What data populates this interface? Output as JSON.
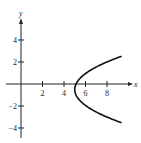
{
  "chart_data": {
    "type": "line",
    "title": "",
    "xlabel": "x",
    "ylabel": "y",
    "xlim": [
      -0.5,
      10
    ],
    "ylim": [
      -5,
      6
    ],
    "grid": false,
    "legend": null,
    "x_ticks": [
      2,
      4,
      6,
      8
    ],
    "y_ticks": [
      4,
      2,
      -2,
      -4
    ],
    "x_tick_labels": [
      "2",
      "4",
      "6",
      "8"
    ],
    "y_tick_labels": [
      "4",
      "2",
      "−2",
      "−4"
    ],
    "series": [
      {
        "name": "parabola opening right",
        "description": "sideways parabola with vertex near (5, -0.5)",
        "x": [
          9.3,
          8.3,
          7.4,
          6.7,
          6.0,
          5.5,
          5.1,
          5.0,
          5.1,
          5.5,
          6.0,
          6.7,
          7.4,
          8.3,
          9.3
        ],
        "y": [
          2.5,
          2.0,
          1.5,
          1.0,
          0.5,
          0.0,
          -0.3,
          -0.5,
          -0.8,
          -1.2,
          -1.6,
          -2.1,
          -2.6,
          -3.0,
          -3.5
        ]
      }
    ],
    "color": "#111111"
  }
}
